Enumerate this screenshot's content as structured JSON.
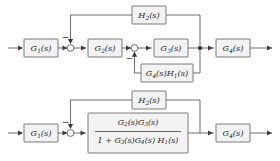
{
  "diagram": {
    "type": "control-system-block-diagram",
    "colors": {
      "block_fill": "#f2f2f2",
      "block_stroke": "#5a5a5a",
      "wire": "#4a4a4a",
      "node_dot": "#2b2b2b",
      "background": "#ffffff",
      "text": "#2a2a2a"
    },
    "upper": {
      "name": "original-block-diagram",
      "blocks": [
        {
          "id": "g1",
          "base": "G",
          "sub": "1",
          "arg": "(s)",
          "text": "G1(s)"
        },
        {
          "id": "g2",
          "base": "G",
          "sub": "2",
          "arg": "(s)",
          "text": "G2(s)"
        },
        {
          "id": "g3",
          "base": "G",
          "sub": "3",
          "arg": "(s)",
          "text": "G3(s)"
        },
        {
          "id": "g4",
          "base": "G",
          "sub": "4",
          "arg": "(s)",
          "text": "G4(s)"
        },
        {
          "id": "h2",
          "base": "H",
          "sub": "2",
          "arg": "(s)",
          "text": "H2(s)"
        }
      ],
      "inner_feedback": {
        "id": "g4h1",
        "text": "G4(s)H1(s)",
        "parts": [
          {
            "base": "G",
            "sub": "4",
            "arg": "(s)"
          },
          {
            "base": "H",
            "sub": "1",
            "arg": "(s)"
          }
        ]
      },
      "summing_junctions": [
        {
          "id": "sum1",
          "sign": "−"
        },
        {
          "id": "sum2",
          "sign": "−"
        }
      ]
    },
    "lower": {
      "name": "reduced-block-diagram",
      "blocks": [
        {
          "id": "g1",
          "base": "G",
          "sub": "1",
          "arg": "(s)",
          "text": "G1(s)"
        },
        {
          "id": "g4",
          "base": "G",
          "sub": "4",
          "arg": "(s)",
          "text": "G4(s)"
        },
        {
          "id": "h2",
          "base": "H",
          "sub": "2",
          "arg": "(s)",
          "text": "H2(s)"
        }
      ],
      "combined_block": {
        "id": "combined",
        "text": "G2(s)G3(s) / (1 + G3(s)G4(s)H1(s))",
        "numerator": {
          "text": "G2(s)G3(s)",
          "parts": [
            {
              "base": "G",
              "sub": "2",
              "arg": "(s)"
            },
            {
              "base": "G",
              "sub": "3",
              "arg": "(s)"
            }
          ]
        },
        "denominator": {
          "text": "1 + G3(s)G4(s)H1(s)",
          "prefix": "1 +",
          "parts": [
            {
              "base": "G",
              "sub": "3",
              "arg": "(s)"
            },
            {
              "base": "G",
              "sub": "4",
              "arg": "(s)"
            },
            {
              "base": "H",
              "sub": "1",
              "arg": "(s)"
            }
          ]
        }
      },
      "summing_junctions": [
        {
          "id": "sum1",
          "sign": "−"
        }
      ]
    }
  }
}
